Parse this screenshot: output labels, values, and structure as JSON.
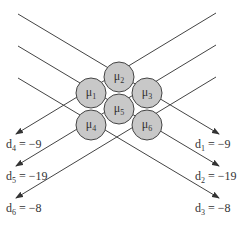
{
  "diagram": {
    "nodes": [
      {
        "id": "mu1",
        "symbol": "μ",
        "sub": "1",
        "cx": 91,
        "cy": 93
      },
      {
        "id": "mu2",
        "symbol": "μ",
        "sub": "2",
        "cx": 119,
        "cy": 77
      },
      {
        "id": "mu3",
        "symbol": "μ",
        "sub": "3",
        "cx": 147,
        "cy": 93
      },
      {
        "id": "mu4",
        "symbol": "μ",
        "sub": "4",
        "cx": 91,
        "cy": 125
      },
      {
        "id": "mu5",
        "symbol": "μ",
        "sub": "5",
        "cx": 119,
        "cy": 109
      },
      {
        "id": "mu6",
        "symbol": "μ",
        "sub": "6",
        "cx": 147,
        "cy": 125
      }
    ],
    "node_fill": "#c8c8c8",
    "node_stroke": "#444444",
    "line_color": "#444444",
    "outputs_left": [
      {
        "name": "d",
        "sub": "4",
        "value": "= −9"
      },
      {
        "name": "d",
        "sub": "5",
        "value": "= −19"
      },
      {
        "name": "d",
        "sub": "6",
        "value": "= −8"
      }
    ],
    "outputs_right": [
      {
        "name": "d",
        "sub": "1",
        "value": "= −9"
      },
      {
        "name": "d",
        "sub": "2",
        "value": "= −19"
      },
      {
        "name": "d",
        "sub": "3",
        "value": "= −8"
      }
    ]
  }
}
